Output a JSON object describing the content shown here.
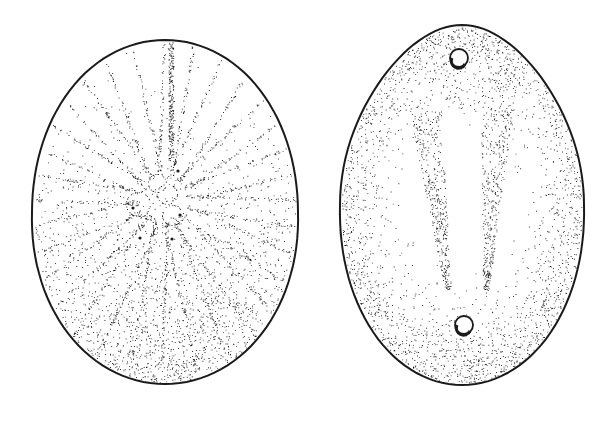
{
  "figure": {
    "background": "#ffffff",
    "ink": "#1a1a1a",
    "style": "stipple pen-and-ink",
    "views": [
      {
        "id": "aboral-view",
        "label": "",
        "outline": {
          "cx": 165,
          "cy": 212,
          "rx": 133,
          "ry": 172
        },
        "apical_disc": {
          "cx": 163,
          "cy": 200
        },
        "ambulacral_rays": 16,
        "shading": "dense stipple toward lower margin"
      },
      {
        "id": "oral-view",
        "label": "",
        "outline": {
          "cx": 462,
          "cy": 205,
          "rx": 122,
          "ry": 180
        },
        "periproct": {
          "cx": 459,
          "cy": 58,
          "r": 9
        },
        "peristome": {
          "cx": 464,
          "cy": 325,
          "r": 9
        },
        "shading": "stipple along margins with two tapering central bands"
      }
    ]
  }
}
